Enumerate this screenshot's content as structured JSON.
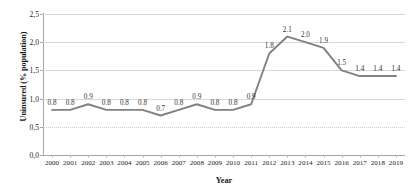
{
  "chart_data": {
    "type": "line",
    "title": "",
    "xlabel": "Year",
    "ylabel": "Uninsured (% population)",
    "categories": [
      "2000",
      "2001",
      "2002",
      "2003",
      "2004",
      "2005",
      "2006",
      "2007",
      "2008",
      "2009",
      "2010",
      "2011",
      "2012",
      "2013",
      "2014",
      "2015",
      "2016",
      "2017",
      "2018",
      "2019"
    ],
    "values": [
      0.8,
      0.8,
      0.9,
      0.8,
      0.8,
      0.8,
      0.7,
      0.8,
      0.9,
      0.8,
      0.8,
      0.9,
      1.8,
      2.1,
      2.0,
      1.9,
      1.5,
      1.4,
      1.4,
      1.4
    ],
    "point_labels": [
      "0.8",
      "0.8",
      "0.9",
      "0.8",
      "0.8",
      "0.8",
      "0.7",
      "0.8",
      "0.9",
      "0.8",
      "0.8",
      "0.9",
      "1.8",
      "2.1",
      "2.0",
      "1.9",
      "1.5",
      "1.4",
      "1.4",
      "1.4"
    ],
    "ylim": [
      0.0,
      2.5
    ],
    "ytick_values": [
      0.0,
      0.5,
      1.0,
      1.5,
      2.0,
      2.5
    ],
    "ytick_labels": [
      "0,0",
      "0,5",
      "1,0",
      "1,5",
      "2,0",
      "2,5"
    ],
    "grid": true,
    "legend": "none",
    "series_color": "#808080",
    "gridline_color": "#d9d9d9",
    "axis_color": "#a6a6a6",
    "text_color": "#262626",
    "background_color": "#ffffff"
  }
}
